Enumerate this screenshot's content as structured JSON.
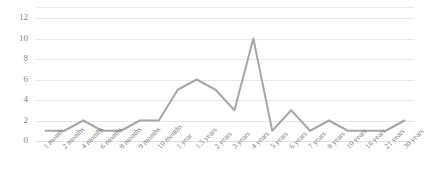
{
  "chart_data": {
    "type": "line",
    "title": "",
    "subtitle": "",
    "xlabel": "",
    "ylabel": "",
    "categories": [
      "1 month",
      "2 months",
      "4 months",
      "6 months",
      "8 months",
      "9 months",
      "10 months",
      "1 year",
      "1.5 years",
      "2 years",
      "3 years",
      "4 years",
      "5 years",
      "6 years",
      "7 years",
      "8 years",
      "10 years",
      "16 years",
      "21 years",
      "30 years"
    ],
    "values": [
      1,
      1,
      2,
      1,
      1,
      2,
      2,
      5,
      6,
      5,
      3,
      10,
      1,
      3,
      1,
      2,
      1,
      1,
      1,
      2
    ],
    "series": [
      {
        "name": "",
        "values": [
          1,
          1,
          2,
          1,
          1,
          2,
          2,
          5,
          6,
          5,
          3,
          10,
          1,
          3,
          1,
          2,
          1,
          1,
          1,
          2
        ]
      }
    ],
    "ylim": [
      0,
      12
    ],
    "yticks": [
      0,
      2,
      4,
      6,
      8,
      10,
      12
    ],
    "ytick_labels": [
      "0",
      "2",
      "4",
      "6",
      "8",
      "10",
      "12"
    ],
    "grid": true,
    "grid_axis": "y",
    "legend": false,
    "legend_position": "none",
    "line_color": "#a6a6a6",
    "grid_color": "#e8e8e8",
    "background_color": "#ffffff",
    "text_color": "#7b7b7b",
    "markers": false,
    "line_width": 2
  }
}
